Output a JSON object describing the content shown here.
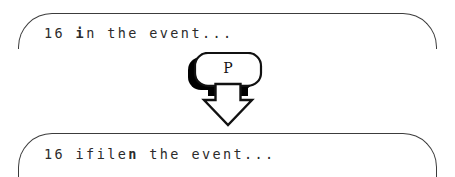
{
  "canvas": {
    "width": 455,
    "height": 177,
    "background": "#ffffff",
    "ink_color": "#3c3c3c",
    "text_color": "#2b2b2b"
  },
  "top_box": {
    "name": "before-state-text-box",
    "text_prefix": "16 ",
    "text_bold": "i",
    "text_suffix": "n the event..."
  },
  "bottom_box": {
    "name": "after-state-text-box",
    "text_prefix": "16 ifile",
    "text_bold": "n",
    "text_suffix": " the event..."
  },
  "pointer": {
    "key_label": "P",
    "key_shadow_color": "#000000",
    "key_fill": "#ffffff",
    "key_outline": "#111111",
    "arrow_name": "down-arrow-icon",
    "arrow_fill": "#ffffff",
    "arrow_outline": "#111111",
    "direction": "down"
  }
}
